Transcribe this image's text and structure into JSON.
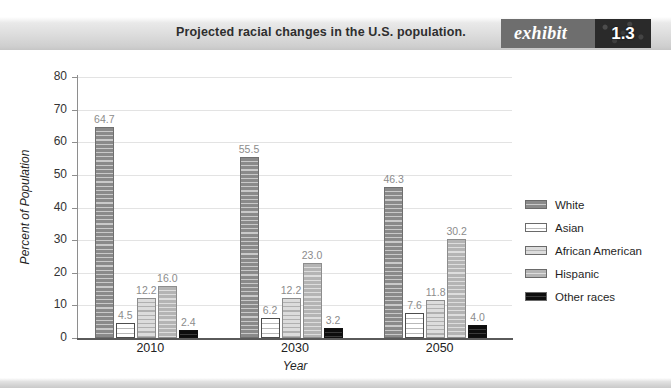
{
  "header": {
    "title": "Projected racial changes in the U.S. population.",
    "exhibit_word": "exhibit",
    "exhibit_number": "1.3"
  },
  "chart_data": {
    "type": "bar",
    "title": "Projected racial changes in the U.S. population.",
    "xlabel": "Year",
    "ylabel": "Percent of Population",
    "categories": [
      "2010",
      "2030",
      "2050"
    ],
    "ylim": [
      0,
      80
    ],
    "yticks": [
      "0",
      "10",
      "20",
      "30",
      "40",
      "50",
      "60",
      "70",
      "80"
    ],
    "grid": true,
    "legend_position": "right",
    "series": [
      {
        "name": "White",
        "color": "#8a8a8a",
        "values": [
          64.7,
          55.5,
          46.3
        ],
        "labels": [
          "64.7",
          "55.5",
          "46.3"
        ]
      },
      {
        "name": "Asian",
        "color": "#ffffff",
        "values": [
          4.5,
          6.2,
          7.6
        ],
        "labels": [
          "4.5",
          "6.2",
          "7.6"
        ]
      },
      {
        "name": "African American",
        "color": "#dcdcdc",
        "values": [
          12.2,
          12.2,
          11.8
        ],
        "labels": [
          "12.2",
          "12.2",
          "11.8"
        ]
      },
      {
        "name": "Hispanic",
        "color": "#b4b4b4",
        "values": [
          16.0,
          23.0,
          30.2
        ],
        "labels": [
          "16.0",
          "23.0",
          "30.2"
        ]
      },
      {
        "name": "Other races",
        "color": "#0d0d0d",
        "values": [
          2.4,
          3.2,
          4.0
        ],
        "labels": [
          "2.4",
          "3.2",
          "4.0"
        ]
      }
    ]
  }
}
